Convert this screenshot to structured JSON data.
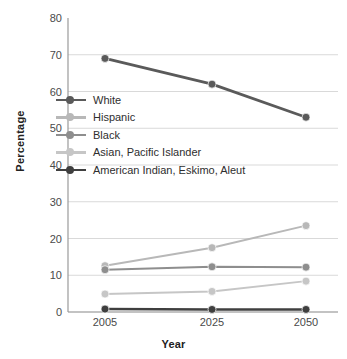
{
  "chart_data": {
    "type": "line",
    "title": "",
    "xlabel": "Year",
    "ylabel": "Percentage",
    "categories": [
      "2005",
      "2025",
      "2050"
    ],
    "x": [
      2005,
      2025,
      2050
    ],
    "ylim": [
      0,
      80
    ],
    "yticks": [
      "0",
      "10",
      "20",
      "30",
      "40",
      "50",
      "60",
      "70",
      "80"
    ],
    "ytick_values": [
      0,
      10,
      20,
      30,
      40,
      50,
      60,
      70,
      80
    ],
    "grid": "horizontal",
    "legend_position": "inside-upper-left",
    "series": [
      {
        "name": "White",
        "values": [
          69,
          62,
          53
        ],
        "color": "#5a5a5a",
        "marker": "circle",
        "line_width": 2.8
      },
      {
        "name": "Hispanic",
        "values": [
          12.6,
          17.5,
          23.5
        ],
        "color": "#b8b8b8",
        "marker": "circle",
        "line_width": 2.0
      },
      {
        "name": "Black",
        "values": [
          11.5,
          12.3,
          12.2
        ],
        "color": "#8e8e8e",
        "marker": "circle",
        "line_width": 2.0
      },
      {
        "name": "Asian, Pacific Islander",
        "values": [
          4.9,
          5.6,
          8.4
        ],
        "color": "#c6c6c6",
        "marker": "circle",
        "line_width": 2.0
      },
      {
        "name": "American Indian, Eskimo, Aleut",
        "values": [
          0.8,
          0.7,
          0.7
        ],
        "color": "#3f3f3f",
        "marker": "circle",
        "line_width": 2.4
      }
    ]
  },
  "axis": {
    "y_label": "Percentage",
    "x_label": "Year"
  },
  "colors": {
    "background": "#ffffff",
    "gridline": "#d9d9d9",
    "axis_line": "#9a9a9a",
    "tick_text": "#4a4a4a",
    "label_text": "#222222"
  }
}
